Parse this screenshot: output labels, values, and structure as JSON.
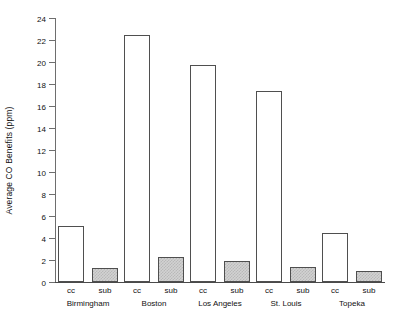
{
  "chart_data": {
    "type": "bar",
    "title": "",
    "subtitle": "",
    "xlabel": "",
    "ylabel": "Average CO Benefits (ppm)",
    "ylim": [
      0,
      24
    ],
    "y_ticks": [
      0,
      2,
      4,
      6,
      8,
      10,
      12,
      14,
      16,
      18,
      20,
      22,
      24
    ],
    "grid": false,
    "legend": "none",
    "categories": [
      "Birmingham",
      "Boston",
      "Los Angeles",
      "St. Louis",
      "Topeka"
    ],
    "series": [
      {
        "name": "cc",
        "label": "cc",
        "fill": "white",
        "values": [
          5.1,
          22.5,
          19.7,
          17.4,
          4.5
        ]
      },
      {
        "name": "sub",
        "label": "sub",
        "fill": "gray-stipple",
        "values": [
          1.3,
          2.3,
          1.9,
          1.4,
          1.0
        ]
      }
    ],
    "colors": {
      "cc_fill": "#ffffff",
      "sub_fill": "#d2d2d2",
      "bar_outline": "#4f4f4f",
      "axis": "#6e6e6e",
      "text": "#111111",
      "background": "#ffffff"
    }
  }
}
